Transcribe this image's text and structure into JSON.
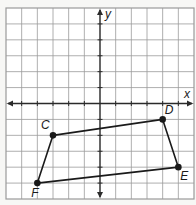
{
  "diagram": {
    "type": "coordinate-plane",
    "axes": {
      "x_label": "x",
      "y_label": "y",
      "x_range": [
        -6,
        6
      ],
      "y_range": [
        -6,
        6
      ],
      "grid": true,
      "grid_step": 1
    },
    "polygon": {
      "name": "CDEF",
      "vertices": [
        {
          "label": "C",
          "x": -3,
          "y": -2
        },
        {
          "label": "D",
          "x": 4,
          "y": -1
        },
        {
          "label": "E",
          "x": 5,
          "y": -4
        },
        {
          "label": "F",
          "x": -4,
          "y": -5
        }
      ]
    },
    "colors": {
      "grid": "#9a9a9a",
      "axis": "#2a2a2a",
      "polygon": "#1a1a1a",
      "background": "#f7f7f5"
    }
  }
}
